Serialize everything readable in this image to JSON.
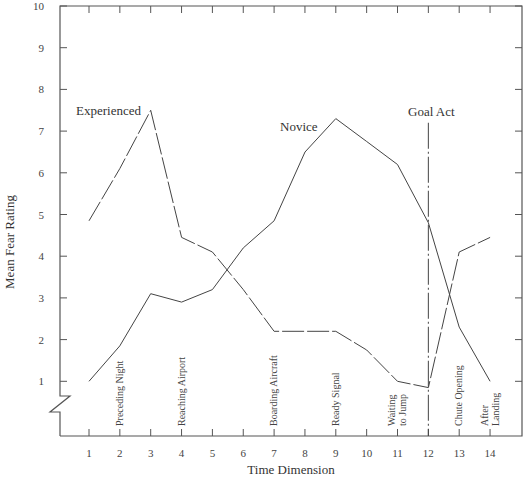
{
  "chart_data": {
    "type": "line",
    "title": "",
    "xlabel": "Time Dimension",
    "ylabel": "Mean Fear Rating",
    "x": [
      1,
      2,
      3,
      4,
      5,
      6,
      7,
      8,
      9,
      10,
      11,
      12,
      13,
      14
    ],
    "xlim": [
      0,
      14.5
    ],
    "ylim": [
      0,
      10
    ],
    "y_ticks": [
      1,
      2,
      3,
      4,
      5,
      6,
      7,
      8,
      9,
      10
    ],
    "y_axis_break": true,
    "grid": false,
    "series": [
      {
        "name": "Experienced",
        "style": "dashed",
        "values": [
          4.85,
          6.1,
          7.5,
          4.45,
          4.1,
          3.2,
          2.2,
          2.2,
          2.2,
          1.75,
          1.0,
          0.85,
          4.1,
          4.45
        ]
      },
      {
        "name": "Novice",
        "style": "solid",
        "values": [
          1.0,
          1.85,
          3.1,
          2.9,
          3.2,
          4.2,
          4.85,
          6.5,
          7.3,
          6.75,
          6.2,
          4.8,
          2.3,
          1.0
        ]
      }
    ],
    "annotations": [
      {
        "text": "Experienced",
        "x": 2.5,
        "y": 7.5
      },
      {
        "text": "Novice",
        "x": 8.5,
        "y": 7.35
      },
      {
        "text": "Goal Act",
        "x": 12.4,
        "y": 7.5
      },
      {
        "type": "vline",
        "x": 12,
        "style": "dash-dot",
        "label": "Goal Act"
      }
    ],
    "phase_labels": [
      {
        "x": 2,
        "lines": [
          "Preceding Night"
        ]
      },
      {
        "x": 4,
        "lines": [
          "Reaching Airport"
        ]
      },
      {
        "x": 7,
        "lines": [
          "Boarding Aircraft"
        ]
      },
      {
        "x": 9,
        "lines": [
          "Ready Signal"
        ]
      },
      {
        "x": 11,
        "lines": [
          "Waiting",
          "to Jump"
        ]
      },
      {
        "x": 13,
        "lines": [
          "Chute Opening"
        ]
      },
      {
        "x": 14,
        "lines": [
          "After",
          "Landing"
        ]
      }
    ]
  }
}
